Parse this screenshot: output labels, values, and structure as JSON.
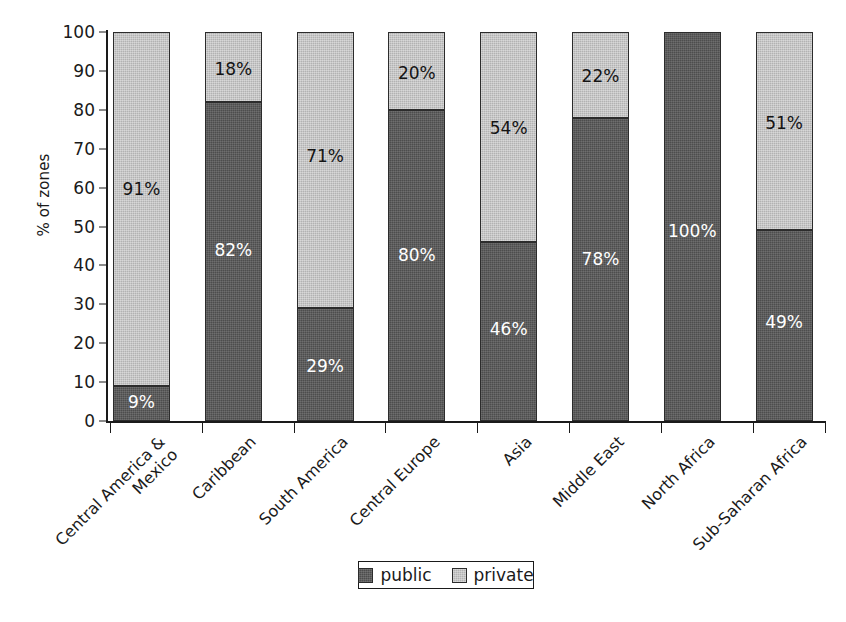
{
  "chart_data": {
    "type": "bar",
    "subtype": "stacked-bar-100-percent",
    "title": "",
    "xlabel": "",
    "ylabel": "% of zones",
    "ylim": [
      0,
      100
    ],
    "ytick_step": 10,
    "yticks": [
      "100",
      "90",
      "80",
      "70",
      "60",
      "50",
      "40",
      "30",
      "20",
      "10",
      "0"
    ],
    "grid": false,
    "legend_position": "bottom-center",
    "categories": [
      "Central America &\nMexico",
      "Caribbean",
      "South America",
      "Central Europe",
      "Asia",
      "Middle East",
      "North Africa",
      "Sub-Saharan Africa"
    ],
    "series": [
      {
        "name": "public",
        "color": "#4d4d4d",
        "values": [
          9,
          82,
          29,
          80,
          46,
          78,
          100,
          49
        ],
        "labels": [
          "9%",
          "82%",
          "29%",
          "80%",
          "46%",
          "78%",
          "100%",
          "49%"
        ],
        "label_visible": [
          true,
          true,
          true,
          true,
          true,
          true,
          true,
          true
        ]
      },
      {
        "name": "private",
        "color": "#b2b2b2",
        "values": [
          91,
          18,
          71,
          20,
          54,
          22,
          0,
          51
        ],
        "labels": [
          "91%",
          "18%",
          "71%",
          "20%",
          "54%",
          "22%",
          "",
          "51%"
        ],
        "label_visible": [
          true,
          true,
          true,
          true,
          true,
          true,
          false,
          true
        ]
      }
    ]
  },
  "legend": {
    "items": [
      {
        "label": "public",
        "swatch": "public-swatch"
      },
      {
        "label": "private",
        "swatch": "private-swatch"
      }
    ]
  }
}
